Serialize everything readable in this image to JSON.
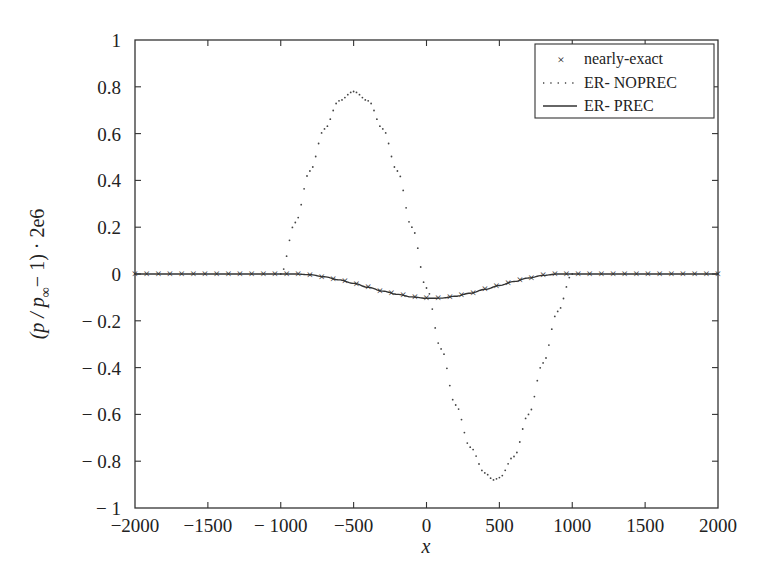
{
  "chart_data": {
    "type": "line",
    "title": "",
    "xlabel": "x",
    "ylabel": "(p / p∞ − 1) · 2e6",
    "xlim": [
      -2000,
      2000
    ],
    "ylim": [
      -1,
      1
    ],
    "grid": false,
    "legend_position": "upper right",
    "x_ticks": [
      -2000,
      -1500,
      -1000,
      -500,
      0,
      500,
      1000,
      1500,
      2000
    ],
    "x_tick_labels": [
      "−2000",
      "−1500",
      "− 1000",
      "−500",
      "0",
      "500",
      "1000",
      "1500",
      "2000"
    ],
    "y_ticks": [
      1,
      0.8,
      0.6,
      0.4,
      0.2,
      0,
      -0.2,
      -0.4,
      -0.6,
      -0.8,
      -1
    ],
    "y_tick_labels": [
      "1",
      "0.8",
      "0.6",
      "0.4",
      "0.2",
      "0",
      "− 0.2",
      "− 0.4",
      "− 0.6",
      "− 0.8",
      "− 1"
    ],
    "series": [
      {
        "name": "nearly-exact",
        "style": "markers-x",
        "x": [
          -2000,
          -1600,
          -1200,
          -1000,
          -900,
          -800,
          -700,
          -600,
          -500,
          -400,
          -300,
          -200,
          -100,
          0,
          100,
          200,
          300,
          400,
          500,
          600,
          700,
          800,
          900,
          1000,
          1200,
          1600,
          2000
        ],
        "y": [
          0,
          0,
          0,
          0,
          0,
          -0.003,
          -0.012,
          -0.025,
          -0.04,
          -0.057,
          -0.073,
          -0.087,
          -0.098,
          -0.104,
          -0.103,
          -0.095,
          -0.082,
          -0.066,
          -0.049,
          -0.032,
          -0.017,
          -0.006,
          0,
          0,
          0,
          0,
          0
        ]
      },
      {
        "name": "ER- NOPREC",
        "style": "dotted",
        "x": [
          -2000,
          -1000,
          -900,
          -800,
          -700,
          -600,
          -500,
          -400,
          -300,
          -200,
          -100,
          0,
          100,
          200,
          300,
          400,
          460,
          500,
          600,
          700,
          800,
          900,
          1000,
          2000
        ],
        "y": [
          0,
          0,
          0.22,
          0.44,
          0.62,
          0.74,
          0.78,
          0.74,
          0.62,
          0.44,
          0.2,
          -0.06,
          -0.32,
          -0.56,
          -0.74,
          -0.85,
          -0.88,
          -0.87,
          -0.78,
          -0.6,
          -0.38,
          -0.16,
          0,
          0
        ]
      },
      {
        "name": "ER- PREC",
        "style": "solid",
        "x": [
          -2000,
          -1000,
          -900,
          -800,
          -700,
          -600,
          -500,
          -400,
          -300,
          -200,
          -100,
          0,
          100,
          200,
          300,
          400,
          500,
          600,
          700,
          800,
          900,
          1000,
          2000
        ],
        "y": [
          0,
          0,
          0,
          -0.003,
          -0.012,
          -0.025,
          -0.04,
          -0.057,
          -0.073,
          -0.087,
          -0.098,
          -0.104,
          -0.103,
          -0.095,
          -0.082,
          -0.066,
          -0.049,
          -0.032,
          -0.017,
          -0.006,
          0,
          0,
          0
        ]
      }
    ]
  },
  "legend": {
    "items": [
      {
        "label": "nearly-exact",
        "symbol": "×"
      },
      {
        "label": "ER- NOPREC",
        "symbol": "dotted"
      },
      {
        "label": "ER- PREC",
        "symbol": "solid"
      }
    ]
  },
  "axes": {
    "xlabel": "x",
    "ylabel_main": "(p / p",
    "ylabel_sub": "∞",
    "ylabel_tail": "− 1) · 2e6"
  }
}
